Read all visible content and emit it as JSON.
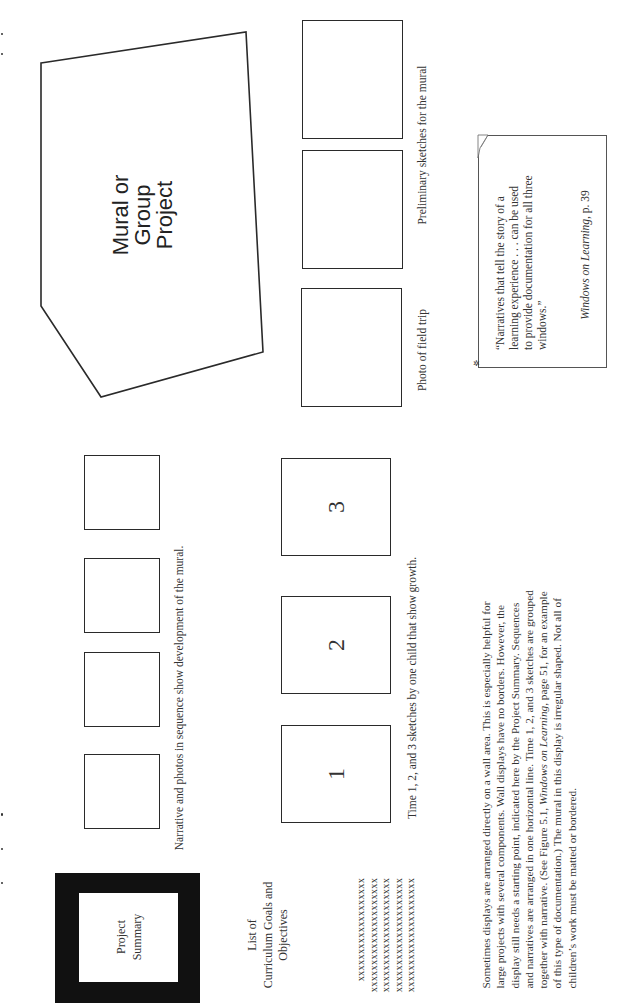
{
  "page": {
    "orientation": "rotated-90-ccw",
    "background": "#ffffff",
    "ink": "#2a2a2a"
  },
  "mural": {
    "label_lines": [
      "Mural or",
      "Group",
      "Project"
    ],
    "polygon_points": "41,63 246,32 263,352 101,397 41,306"
  },
  "field_trip": {
    "boxes": [
      {
        "caption_ref": "preliminary"
      },
      {
        "caption_ref": "preliminary"
      },
      {
        "caption_ref": "field_trip"
      }
    ],
    "caption_field_trip": "Photo of field trip",
    "caption_sketches": "Preliminary sketches for the mural"
  },
  "quote": {
    "text": "“Narratives that tell the story of a learning experience . . . can be used to provide documentation for all three windows.”",
    "lines": [
      "“Narratives that tell the story of a",
      "learning experience . . . can be used",
      "to provide documentation for all three",
      "windows.”"
    ],
    "source_title": "Windows on Learning",
    "source_page": ", p.  39",
    "icons": {
      "corner": "page-curl-icon",
      "pin": "pin-icon"
    }
  },
  "sequence": {
    "box_count": 4,
    "caption": "Narrative and photos in sequence show development of the mural."
  },
  "growth": {
    "boxes": [
      {
        "label": "3"
      },
      {
        "label": "2"
      },
      {
        "label": "1"
      }
    ],
    "caption": "Time 1, 2, and 3 sketches by one child that show growth."
  },
  "project_summary": {
    "label_lines": [
      "Project",
      "Summary"
    ],
    "frame_color": "#111111"
  },
  "curriculum": {
    "title_lines": [
      "List of",
      "Curriculum Goals and",
      "Objectives"
    ],
    "rows": [
      "xxxxxxxxxxxxxxxxxxx",
      "xxxxxxxxxxxxxxxxxxxxx",
      "xxxxxxxxxxxxxxxxxxxxx",
      "xxxxxxxxxxxxxxxxxxxxx",
      "xxxxxxxxxxxxxxxxxxxxx"
    ]
  },
  "paragraph": {
    "lines": [
      "Sometimes displays are arranged directly on a wall area. This is especially helpful for",
      "large projects with several components. Wall displays have no borders. However, the",
      "display still needs a starting point, indicated here by the Project Summary. Sequences",
      "and narratives are arranged in one horizontal line. Time 1, 2, and 3 sketches are grouped",
      "together with narrative. (See Figure 5.1, ",
      "of this type of documentation.) The mural in this display is irregular shaped. Not all of",
      "children’s work must be matted or bordered."
    ],
    "line5_italic": "Windows on Learning",
    "line5_rest": ", page 51, for an example"
  }
}
